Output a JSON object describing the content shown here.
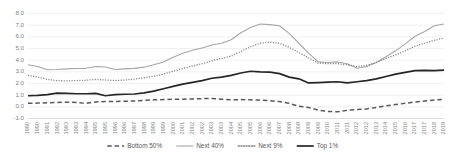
{
  "chart_data": {
    "type": "line",
    "title": "",
    "subtitle": "",
    "xlabel": "",
    "ylabel": "",
    "ylim": [
      -1.0,
      8.0
    ],
    "ytick_labels": [
      "8.0",
      "7.0",
      "6.0",
      "5.0",
      "4.0",
      "3.0",
      "2.0",
      "1.0",
      "0.0",
      "-1.0"
    ],
    "ytick_values": [
      8.0,
      7.0,
      6.0,
      5.0,
      4.0,
      3.0,
      2.0,
      1.0,
      0.0,
      -1.0
    ],
    "grid": true,
    "legend_position": "bottom",
    "x": [
      1990,
      1990,
      1991,
      1992,
      1993,
      1993,
      1994,
      1995,
      1995,
      1996,
      1996,
      1997,
      1998,
      1999,
      1999,
      2000,
      2001,
      2002,
      2002,
      2003,
      2003,
      2004,
      2005,
      2005,
      2006,
      2006,
      2007,
      2008,
      2008,
      2009,
      2009,
      2010,
      2011,
      2011,
      2012,
      2012,
      2013,
      2014,
      2015,
      2016,
      2017,
      2017,
      2018,
      2019
    ],
    "categories": [
      "1990",
      "1990",
      "1991",
      "1992",
      "1993",
      "1993",
      "1994",
      "1995",
      "1995",
      "1996",
      "1996",
      "1997",
      "1998",
      "1999",
      "1999",
      "2000",
      "2001",
      "2002",
      "2002",
      "2003",
      "2003",
      "2004",
      "2005",
      "2005",
      "2006",
      "2006",
      "2007",
      "2008",
      "2008",
      "2009",
      "2009",
      "2010",
      "2011",
      "2011",
      "2012",
      "2012",
      "2013",
      "2014",
      "2015",
      "2016",
      "2017",
      "2017",
      "2018",
      "2019"
    ],
    "series": [
      {
        "name": "Bottom 50%",
        "style": "dashed",
        "color": "#595959",
        "width": 1.5,
        "values": [
          0.3,
          0.32,
          0.35,
          0.38,
          0.4,
          0.38,
          0.3,
          0.42,
          0.45,
          0.46,
          0.48,
          0.5,
          0.55,
          0.6,
          0.62,
          0.65,
          0.65,
          0.68,
          0.7,
          0.72,
          0.66,
          0.6,
          0.62,
          0.6,
          0.58,
          0.52,
          0.45,
          0.3,
          0.05,
          -0.05,
          -0.28,
          -0.4,
          -0.42,
          -0.3,
          -0.22,
          -0.18,
          -0.05,
          0.08,
          0.2,
          0.3,
          0.42,
          0.5,
          0.58,
          0.65
        ]
      },
      {
        "name": "Next 40%",
        "style": "solid",
        "color": "#a6a6a6",
        "width": 1.1,
        "values": [
          3.6,
          3.45,
          3.18,
          3.2,
          3.25,
          3.28,
          3.3,
          3.45,
          3.42,
          3.2,
          3.25,
          3.3,
          3.4,
          3.6,
          3.85,
          4.25,
          4.6,
          4.85,
          5.05,
          5.3,
          5.45,
          5.75,
          6.35,
          6.8,
          7.1,
          7.05,
          6.95,
          6.3,
          5.45,
          4.6,
          3.85,
          3.8,
          3.85,
          3.7,
          3.3,
          3.45,
          3.8,
          4.3,
          4.8,
          5.4,
          6.05,
          6.45,
          6.95,
          7.1
        ]
      },
      {
        "name": "Next 9%",
        "style": "dotted",
        "color": "#7f7f7f",
        "width": 1.3,
        "values": [
          2.7,
          2.55,
          2.35,
          2.25,
          2.22,
          2.25,
          2.28,
          2.35,
          2.3,
          2.25,
          2.3,
          2.38,
          2.48,
          2.62,
          2.8,
          3.05,
          3.28,
          3.5,
          3.7,
          3.95,
          4.15,
          4.35,
          4.75,
          5.15,
          5.45,
          5.55,
          5.45,
          5.1,
          4.65,
          4.2,
          3.75,
          3.7,
          3.7,
          3.6,
          3.45,
          3.55,
          3.8,
          4.15,
          4.45,
          4.8,
          5.2,
          5.45,
          5.7,
          5.9
        ]
      },
      {
        "name": "Top 1%",
        "style": "solid",
        "color": "#262626",
        "width": 1.7,
        "values": [
          0.95,
          0.98,
          1.05,
          1.18,
          1.15,
          1.12,
          1.12,
          1.15,
          0.95,
          1.05,
          1.08,
          1.1,
          1.2,
          1.35,
          1.55,
          1.75,
          1.95,
          2.1,
          2.25,
          2.45,
          2.55,
          2.7,
          2.9,
          3.05,
          3.0,
          2.98,
          2.85,
          2.55,
          2.4,
          2.05,
          2.08,
          2.12,
          2.15,
          2.05,
          2.15,
          2.25,
          2.4,
          2.6,
          2.8,
          2.95,
          3.1,
          3.12,
          3.1,
          3.15
        ]
      }
    ]
  },
  "legend": {
    "items": [
      {
        "label": "Bottom 50%",
        "swatch": "dashed-line-swatch"
      },
      {
        "label": "Next 40%",
        "swatch": "solid-gray-line-swatch"
      },
      {
        "label": "Next 9%",
        "swatch": "dotted-line-swatch"
      },
      {
        "label": "Top 1%",
        "swatch": "solid-dark-line-swatch"
      }
    ]
  }
}
